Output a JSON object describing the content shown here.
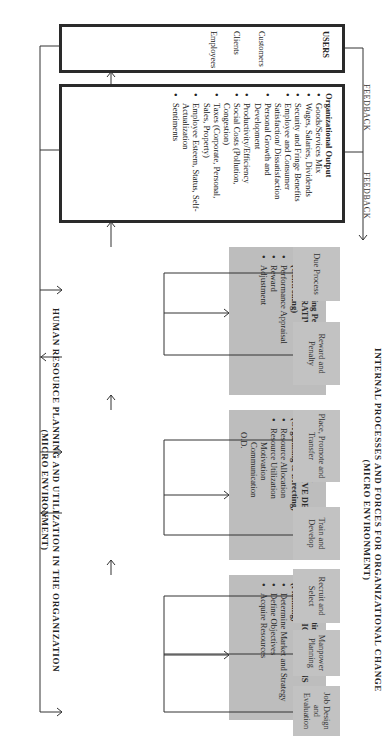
{
  "titles": {
    "top": "HUMAN RESOURCE PLANNING AND UTILIZATION IN THE ORGANIZATION",
    "top_sub": "(MICRO ENVIRONMENT)",
    "bottom": "INTERNAL PROCESSES AND FORCES FOR ORGANIZATIONAL CHANGE",
    "bottom_sub": "(MICRO ENVIRONMENT)"
  },
  "decisions": [
    {
      "period": "Pre-Operating Period",
      "heading": "STRATEGIC DECISIONS",
      "function": "(Planning)",
      "items": [
        "Determine Market and Strategy",
        "Define Objectives",
        "Acquire Resources"
      ],
      "sub_items": []
    },
    {
      "period": "Operating Period",
      "heading": "ADMINISTRATIVE DECISIONS",
      "function": "(Organizing & Directing)",
      "items": [
        "Resource Allocation",
        "Resource Utilization"
      ],
      "sub_items": [
        "Motivation",
        "Communication",
        "O.D."
      ]
    },
    {
      "period": "Post-Operating Period",
      "heading": "ADMINISTRATIVE DECISIONS",
      "function": "(Controlling)",
      "items": [
        "Performance Appraisal",
        "Reward",
        "Adjustment"
      ],
      "sub_items": []
    }
  ],
  "output": {
    "heading": "Organizational Output",
    "items": [
      "Goods/Services Mix",
      "Wages, Salaries, Dividends",
      "Security and Fringe Benefits",
      "Employee and Consumer Satisfaction/ Dissatisfaction",
      "Personal Growth and Development",
      "Productivity/Efficiency",
      "Social Costs (Pollution, Congestion)",
      "Taxes (Corporate, Personal, Sales, Property)",
      "Employee Esteem, Status, Self-Actualization",
      "Sentiments"
    ]
  },
  "users": {
    "heading": "USERS",
    "items": [
      "Customers",
      "Clients",
      "Employees"
    ]
  },
  "feedback": [
    "FEEDBACK",
    "FEEDBACK"
  ],
  "processes": [
    "Job Design and Evaluation",
    "Manpower Planning",
    "Recruit and Select",
    "Train and Develop",
    "Place, Promote and Transfer",
    "Reward and Penalty",
    "Due Process"
  ]
}
